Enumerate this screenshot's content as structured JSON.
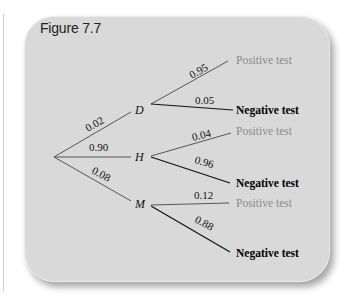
{
  "figure": {
    "title": "Figure 7.7",
    "colors": {
      "panel_background": "#d9d9d9",
      "positive_text": "#8a8a8a",
      "negative_text": "#000000",
      "branch_to_positive": "#555555",
      "branch_to_negative": "#111111"
    },
    "first_level": [
      {
        "node": "D",
        "probability": "0.02"
      },
      {
        "node": "H",
        "probability": "0.90"
      },
      {
        "node": "M",
        "probability": "0.08"
      }
    ],
    "second_level": {
      "D": [
        {
          "outcome": "Positive test",
          "probability": "0.95"
        },
        {
          "outcome": "Negative test",
          "probability": "0.05"
        }
      ],
      "H": [
        {
          "outcome": "Positive test",
          "probability": "0.04"
        },
        {
          "outcome": "Negative test",
          "probability": "0.96"
        }
      ],
      "M": [
        {
          "outcome": "Positive test",
          "probability": "0.12"
        },
        {
          "outcome": "Negative test",
          "probability": "0.88"
        }
      ]
    }
  }
}
